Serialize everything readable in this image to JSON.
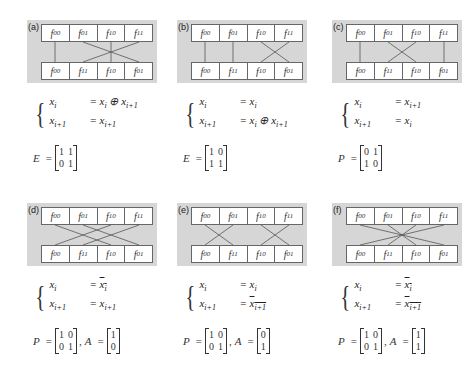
{
  "panels": [
    {
      "label": "(a)",
      "top_row": [
        "f00",
        "f01",
        "f10",
        "f11"
      ],
      "bottom_row": [
        "f00",
        "f11",
        "f10",
        "f01"
      ],
      "connections": [
        [
          0,
          0
        ],
        [
          1,
          3
        ],
        [
          2,
          2
        ],
        [
          3,
          1
        ]
      ],
      "system": {
        "line1_lhs": "x_i",
        "line1_rhs": "= x_i ⊕ x_{i+1}",
        "line2_lhs": "x_{i+1}",
        "line2_rhs": "= x_{i+1}"
      },
      "matrix": {
        "name": "E",
        "rows": [
          [
            "1",
            "1"
          ],
          [
            "0",
            "1"
          ]
        ]
      }
    },
    {
      "label": "(b)",
      "top_row": [
        "f00",
        "f01",
        "f10",
        "f11"
      ],
      "bottom_row": [
        "f00",
        "f11",
        "f10",
        "f01"
      ],
      "connections": [
        [
          0,
          0
        ],
        [
          1,
          1
        ],
        [
          2,
          3
        ],
        [
          3,
          2
        ]
      ],
      "system": {
        "line1_lhs": "x_i",
        "line1_rhs": "= x_i",
        "line2_lhs": "x_{i+1}",
        "line2_rhs": "= x_i ⊕ x_{i+1}"
      },
      "matrix": {
        "name": "E",
        "rows": [
          [
            "1",
            "0"
          ],
          [
            "1",
            "1"
          ]
        ]
      }
    },
    {
      "label": "(c)",
      "top_row": [
        "f00",
        "f01",
        "f10",
        "f11"
      ],
      "bottom_row": [
        "f00",
        "f11",
        "f10",
        "f01"
      ],
      "connections": [
        [
          0,
          0
        ],
        [
          1,
          2
        ],
        [
          2,
          1
        ],
        [
          3,
          3
        ]
      ],
      "system": {
        "line1_lhs": "x_i",
        "line1_rhs": "= x_{i+1}",
        "line2_lhs": "x_{i+1}",
        "line2_rhs": "= x_i"
      },
      "matrix": {
        "name": "P",
        "rows": [
          [
            "0",
            "1"
          ],
          [
            "1",
            "0"
          ]
        ]
      }
    },
    {
      "label": "(d)",
      "top_row": [
        "f00",
        "f01",
        "f10",
        "f11"
      ],
      "bottom_row": [
        "f00",
        "f11",
        "f10",
        "f01"
      ],
      "connections": [
        [
          0,
          2
        ],
        [
          1,
          3
        ],
        [
          2,
          0
        ],
        [
          3,
          1
        ]
      ],
      "system": {
        "line1_lhs": "x_i",
        "line1_rhs": "= x̄_i",
        "line2_lhs": "x_{i+1}",
        "line2_rhs": "= x_{i+1}"
      },
      "matrix": {
        "name": "P",
        "rows": [
          [
            "1",
            "0"
          ],
          [
            "0",
            "1"
          ]
        ]
      },
      "vector": {
        "name": "A",
        "rows": [
          "1",
          "0"
        ]
      }
    },
    {
      "label": "(e)",
      "top_row": [
        "f00",
        "f01",
        "f10",
        "f11"
      ],
      "bottom_row": [
        "f00",
        "f11",
        "f10",
        "f01"
      ],
      "connections": [
        [
          0,
          1
        ],
        [
          1,
          0
        ],
        [
          2,
          3
        ],
        [
          3,
          2
        ]
      ],
      "system": {
        "line1_lhs": "x_i",
        "line1_rhs": "= x_i",
        "line2_lhs": "x_{i+1}",
        "line2_rhs": "= x̄_{i+1}"
      },
      "matrix": {
        "name": "P",
        "rows": [
          [
            "1",
            "0"
          ],
          [
            "0",
            "1"
          ]
        ]
      },
      "vector": {
        "name": "A",
        "rows": [
          "0",
          "1"
        ]
      }
    },
    {
      "label": "(f)",
      "top_row": [
        "f00",
        "f01",
        "f10",
        "f11"
      ],
      "bottom_row": [
        "f00",
        "f11",
        "f10",
        "f01"
      ],
      "connections": [
        [
          0,
          3
        ],
        [
          1,
          2
        ],
        [
          2,
          1
        ],
        [
          3,
          0
        ]
      ],
      "system": {
        "line1_lhs": "x_i",
        "line1_rhs": "= x̄_i",
        "line2_lhs": "x_{i+1}",
        "line2_rhs": "= x̄_{i+1}"
      },
      "matrix": {
        "name": "P",
        "rows": [
          [
            "1",
            "0"
          ],
          [
            "0",
            "1"
          ]
        ]
      },
      "vector": {
        "name": "A",
        "rows": [
          "1",
          "1"
        ]
      }
    }
  ],
  "colors": {
    "panel_bg": "#d6d6d6",
    "line": "#555555",
    "cell_bg": "#ffffff"
  }
}
